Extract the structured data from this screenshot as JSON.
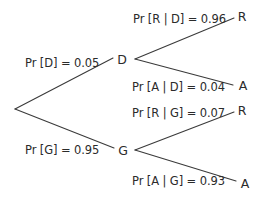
{
  "diagram": {
    "type": "probability-tree",
    "colors": {
      "background": "#ffffff",
      "line": "#3a3a3a",
      "text": "#2b2b2b"
    },
    "nodes": {
      "root": {
        "label": "",
        "x": 15,
        "y": 109
      },
      "D": {
        "label": "D",
        "x": 122,
        "y": 60
      },
      "G": {
        "label": "G",
        "x": 123,
        "y": 151
      },
      "D_R": {
        "label": "R",
        "x": 242,
        "y": 17
      },
      "D_A": {
        "label": "A",
        "x": 243,
        "y": 86
      },
      "G_R": {
        "label": "R",
        "x": 242,
        "y": 111
      },
      "G_A": {
        "label": "A",
        "x": 245,
        "y": 184
      }
    },
    "edges": [
      {
        "from": "root",
        "to": "D",
        "label": "Pr [D] = 0.05",
        "probability": 0.05
      },
      {
        "from": "root",
        "to": "G",
        "label": "Pr [G] = 0.95",
        "probability": 0.95
      },
      {
        "from": "D",
        "to": "D_R",
        "label": "Pr [R | D] = 0.96",
        "probability": 0.96
      },
      {
        "from": "D",
        "to": "D_A",
        "label": "Pr [A | D] = 0.04",
        "probability": 0.04
      },
      {
        "from": "G",
        "to": "G_R",
        "label": "Pr [R | G] = 0.07",
        "probability": 0.07
      },
      {
        "from": "G",
        "to": "G_A",
        "label": "Pr [A | G] = 0.93",
        "probability": 0.93
      }
    ]
  }
}
